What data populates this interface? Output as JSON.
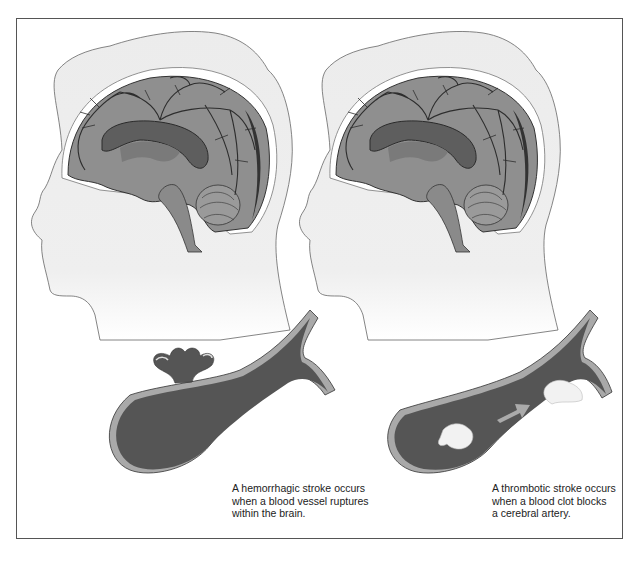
{
  "diagram": {
    "panels": [
      {
        "id": "hemorrhagic",
        "illustration": "sagittal-brain-with-ruptured-vessel",
        "caption_lines": [
          "A hemorrhagic stroke occurs",
          "when a blood vessel ruptures",
          "within the brain."
        ]
      },
      {
        "id": "thrombotic",
        "illustration": "sagittal-brain-with-blood-clot",
        "caption_lines": [
          "A thrombotic stroke occurs",
          "when a blood clot blocks",
          "a cerebral artery."
        ]
      }
    ],
    "colors": {
      "frame": "#555555",
      "head_fill": "#ebebeb",
      "brain_fill": "#8f8f8f",
      "vessel_fill": "#555555",
      "vessel_wall": "#a9a9a9",
      "clot_fill": "#f2f2f2"
    }
  }
}
